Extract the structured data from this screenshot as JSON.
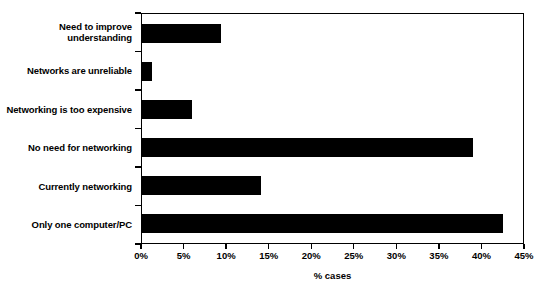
{
  "chart_data": {
    "type": "bar",
    "orientation": "horizontal",
    "title": "",
    "xlabel": "% cases",
    "ylabel": "",
    "categories": [
      "Need to improve\nunderstanding",
      "Networks are unreliable",
      "Networking is too expensive",
      "No need for networking",
      "Currently networking",
      "Only one computer/PC"
    ],
    "values": [
      9.3,
      1.2,
      5.9,
      39.1,
      14.0,
      42.6
    ],
    "xlim": [
      0,
      45
    ],
    "xticks": [
      0,
      5,
      10,
      15,
      20,
      25,
      30,
      35,
      40,
      45
    ],
    "xtick_labels": [
      "0%",
      "5%",
      "10%",
      "15%",
      "20%",
      "25%",
      "30%",
      "35%",
      "40%",
      "45%"
    ],
    "grid": false,
    "legend": false,
    "bar_color": "#000000",
    "background_color": "#ffffff",
    "axis_color": "#000000"
  }
}
